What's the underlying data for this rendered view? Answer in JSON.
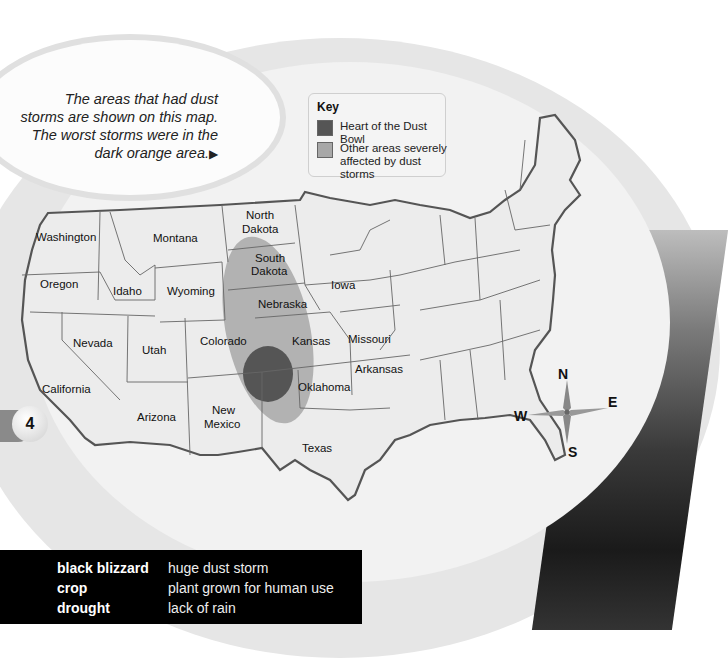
{
  "callout": {
    "text": "The areas that had dust storms are shown on this map. The worst storms were in the dark orange area.",
    "arrow": "▶"
  },
  "key": {
    "title": "Key",
    "items": [
      {
        "label": "Heart of the Dust Bowl",
        "color": "#555555"
      },
      {
        "label": "Other areas severely affected by dust storms",
        "color": "#a8a8a8"
      }
    ]
  },
  "map": {
    "states": [
      {
        "name": "Washington",
        "x": 36,
        "y": 241
      },
      {
        "name": "Montana",
        "x": 153,
        "y": 242
      },
      {
        "name": "North",
        "x": 242,
        "y": 219
      },
      {
        "name": "Dakota",
        "x": 242,
        "y": 233
      },
      {
        "name": "South",
        "x": 256,
        "y": 263
      },
      {
        "name": "Dakota",
        "x": 256,
        "y": 277
      },
      {
        "name": "Oregon",
        "x": 40,
        "y": 289
      },
      {
        "name": "Idaho",
        "x": 103,
        "y": 295
      },
      {
        "name": "Wyoming",
        "x": 170,
        "y": 295
      },
      {
        "name": "Nebraska",
        "x": 285,
        "y": 307
      },
      {
        "name": "Iowa",
        "x": 343,
        "y": 289
      },
      {
        "name": "Nevada",
        "x": 93,
        "y": 344
      },
      {
        "name": "Utah",
        "x": 134,
        "y": 351
      },
      {
        "name": "Colorado",
        "x": 223,
        "y": 342
      },
      {
        "name": "Kansas",
        "x": 310,
        "y": 342
      },
      {
        "name": "Missouri",
        "x": 370,
        "y": 342
      },
      {
        "name": "Arkansas",
        "x": 380,
        "y": 372
      },
      {
        "name": "California",
        "x": 37,
        "y": 392
      },
      {
        "name": "Oklahoma",
        "x": 318,
        "y": 391
      },
      {
        "name": "Arizona",
        "x": 155,
        "y": 422
      },
      {
        "name": "New",
        "x": 223,
        "y": 414
      },
      {
        "name": "Mexico",
        "x": 223,
        "y": 428
      },
      {
        "name": "Texas",
        "x": 318,
        "y": 453
      }
    ],
    "compass": {
      "n": "N",
      "e": "E",
      "s": "S",
      "w": "W"
    },
    "colors": {
      "heart": "#555555",
      "affected": "#a8a8a8",
      "land": "#efefef",
      "border": "#555555"
    }
  },
  "page": {
    "number": "4"
  },
  "glossary": [
    {
      "term": "black blizzard",
      "definition": "huge dust storm"
    },
    {
      "term": "crop",
      "definition": "plant grown for human use"
    },
    {
      "term": "drought",
      "definition": "lack of rain"
    }
  ]
}
